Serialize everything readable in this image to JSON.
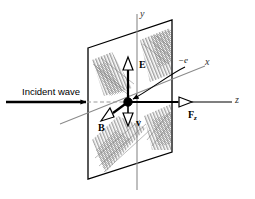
{
  "figure": {
    "background_color": "#ffffff",
    "axes": {
      "y": {
        "label": "y",
        "color": "#8a8a8a",
        "orientation": "vertical"
      },
      "z": {
        "label": "z",
        "color": "#000000",
        "orientation": "horizontal"
      },
      "x": {
        "label": "x",
        "color": "#8a8a8a",
        "orientation": "diagonal-out-of-page"
      }
    },
    "charge": {
      "label": "−e",
      "marker": "filled-dot",
      "color": "#000000"
    },
    "incident_wave": {
      "label": "Incident wave",
      "arrow_color": "#000000"
    },
    "wavefront_plane": {
      "name": "wavefront-plane",
      "stroke": "#000000",
      "fill": "#ffffff",
      "hatch_color": "#7d7d7d"
    },
    "vectors": [
      {
        "id": "E",
        "label": "E",
        "direction": "up",
        "color": "#000000"
      },
      {
        "id": "B",
        "label": "B",
        "direction": "down-left",
        "color": "#000000"
      },
      {
        "id": "v",
        "label": "v",
        "direction": "down",
        "color": "#000000"
      },
      {
        "id": "Fz",
        "label": "F",
        "subscript": "z",
        "direction": "right",
        "color": "#000000"
      }
    ]
  }
}
